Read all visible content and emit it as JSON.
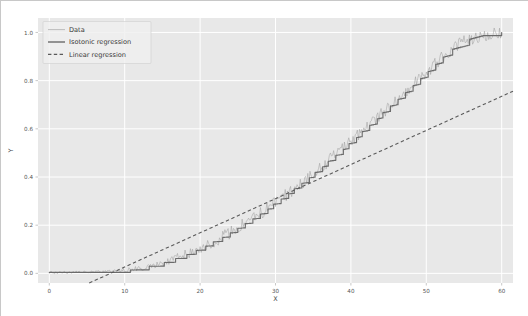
{
  "chart_data": {
    "type": "line",
    "title": "",
    "xlabel": "X",
    "ylabel": "Y",
    "xlim": [
      -1.5,
      61.5
    ],
    "ylim": [
      -0.04,
      1.06
    ],
    "xticks": [
      "0",
      "10",
      "20",
      "30",
      "40",
      "50",
      "60"
    ],
    "xtick_values": [
      0,
      10,
      20,
      30,
      40,
      50,
      60
    ],
    "yticks": [
      "0.0",
      "0.2",
      "0.4",
      "0.6",
      "0.8",
      "1.0"
    ],
    "ytick_values": [
      0.0,
      0.2,
      0.4,
      0.6,
      0.8,
      1.0
    ],
    "grid": true,
    "grid_color": "#ffffff",
    "plot_bgcolor": "#e8e8e8",
    "figure_bgcolor": "#ffffff",
    "legend_position": "upper left",
    "series": [
      {
        "name": "Data",
        "style": "noisy-line",
        "color": "#9a9a9a",
        "linewidth": 0.5,
        "x": [
          0,
          1,
          2,
          3,
          4,
          5,
          6,
          7,
          8,
          9,
          10,
          11,
          12,
          13,
          14,
          15,
          16,
          17,
          18,
          19,
          20,
          21,
          22,
          23,
          24,
          25,
          26,
          27,
          28,
          29,
          30,
          31,
          32,
          33,
          34,
          35,
          36,
          37,
          38,
          39,
          40,
          41,
          42,
          43,
          44,
          45,
          46,
          47,
          48,
          49,
          50,
          51,
          52,
          53,
          54,
          55,
          56,
          57,
          58,
          59,
          60
        ],
        "values": [
          0.004,
          0.003,
          0.005,
          0.004,
          0.006,
          0.005,
          0.007,
          0.006,
          0.008,
          0.009,
          0.012,
          0.016,
          0.021,
          0.028,
          0.035,
          0.044,
          0.054,
          0.065,
          0.077,
          0.09,
          0.104,
          0.119,
          0.135,
          0.152,
          0.17,
          0.189,
          0.208,
          0.228,
          0.249,
          0.271,
          0.293,
          0.316,
          0.34,
          0.364,
          0.389,
          0.414,
          0.44,
          0.466,
          0.493,
          0.52,
          0.548,
          0.576,
          0.604,
          0.632,
          0.661,
          0.69,
          0.719,
          0.748,
          0.777,
          0.806,
          0.835,
          0.864,
          0.892,
          0.92,
          0.944,
          0.963,
          0.976,
          0.984,
          0.99,
          0.995,
          1.0
        ],
        "noise_amplitude": 0.022
      },
      {
        "name": "Isotonic regression",
        "style": "step-line",
        "color": "#6b6b6b",
        "linewidth": 1.1,
        "x": [
          0,
          1,
          2,
          3,
          4,
          5,
          6,
          7,
          8,
          9,
          10,
          11,
          12,
          13,
          14,
          15,
          16,
          17,
          18,
          19,
          20,
          21,
          22,
          23,
          24,
          25,
          26,
          27,
          28,
          29,
          30,
          31,
          32,
          33,
          34,
          35,
          36,
          37,
          38,
          39,
          40,
          41,
          42,
          43,
          44,
          45,
          46,
          47,
          48,
          49,
          50,
          51,
          52,
          53,
          54,
          55,
          56,
          57,
          58,
          59,
          60
        ],
        "values": [
          0.004,
          0.004,
          0.004,
          0.005,
          0.005,
          0.005,
          0.006,
          0.006,
          0.007,
          0.009,
          0.012,
          0.016,
          0.021,
          0.028,
          0.035,
          0.044,
          0.054,
          0.065,
          0.077,
          0.09,
          0.104,
          0.119,
          0.135,
          0.152,
          0.17,
          0.189,
          0.208,
          0.228,
          0.249,
          0.271,
          0.293,
          0.316,
          0.34,
          0.364,
          0.389,
          0.414,
          0.44,
          0.466,
          0.493,
          0.52,
          0.548,
          0.576,
          0.604,
          0.632,
          0.661,
          0.69,
          0.719,
          0.748,
          0.777,
          0.806,
          0.835,
          0.864,
          0.892,
          0.92,
          0.944,
          0.963,
          0.976,
          0.984,
          0.99,
          0.995,
          1.0
        ]
      },
      {
        "name": "Linear regression",
        "style": "dashed-line",
        "color": "#5a5a5a",
        "linewidth": 1.1,
        "x": [
          0,
          60
        ],
        "values": [
          -0.115,
          0.735
        ],
        "x_intercept": 8.1
      }
    ],
    "legend_entries": [
      {
        "label": "Data",
        "style": "noisy-line",
        "color": "#9a9a9a"
      },
      {
        "label": "Isotonic regression",
        "style": "step-line",
        "color": "#6b6b6b"
      },
      {
        "label": "Linear regression",
        "style": "dashed-line",
        "color": "#5a5a5a"
      }
    ]
  },
  "figure": {
    "axis_x_title": "X",
    "axis_y_title": "Y"
  }
}
